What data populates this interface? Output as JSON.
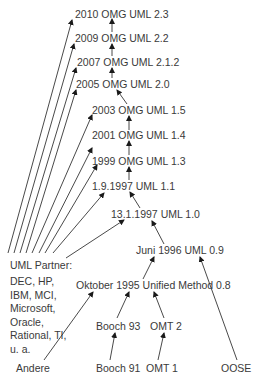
{
  "diagram": {
    "nodes": {
      "uml23": "2010 OMG UML 2.3",
      "uml22": "2009 OMG UML 2.2",
      "uml212": "2007 OMG UML 2.1.2",
      "uml20": "2005 OMG UML 2.0",
      "uml15": "2003 OMG UML 1.5",
      "uml14": "2001 OMG UML 1.4",
      "uml13": "1999 OMG UML 1.3",
      "uml11": "1.9.1997 UML 1.1",
      "uml10": "13.1.1997 UML 1.0",
      "uml09": "Juni 1996 UML 0.9",
      "um08": "Oktober 1995 Unified Method 0.8",
      "booch93": "Booch 93",
      "omt2": "OMT 2",
      "booch91": "Booch 91",
      "omt1": "OMT 1",
      "oose": "OOSE",
      "andere": "Andere",
      "partner": "UML Partner:",
      "partner_list": "DEC, HP,\nIBM, MCI,\nMicrosoft,\nOracle,\nRational, TI,\nu. a."
    },
    "edges": [
      [
        "uml22",
        "uml23"
      ],
      [
        "uml212",
        "uml22"
      ],
      [
        "uml20",
        "uml212"
      ],
      [
        "uml15",
        "uml20"
      ],
      [
        "uml14",
        "uml15"
      ],
      [
        "uml13",
        "uml14"
      ],
      [
        "uml11",
        "uml13"
      ],
      [
        "uml10",
        "uml11"
      ],
      [
        "uml09",
        "uml10"
      ],
      [
        "um08",
        "uml09"
      ],
      [
        "booch93",
        "um08"
      ],
      [
        "omt2",
        "um08"
      ],
      [
        "booch91",
        "booch93"
      ],
      [
        "omt1",
        "omt2"
      ],
      [
        "oose",
        "uml09"
      ],
      [
        "andere",
        "um08"
      ],
      [
        "partner",
        "uml23"
      ],
      [
        "partner",
        "uml22"
      ],
      [
        "partner",
        "uml212"
      ],
      [
        "partner",
        "uml20"
      ],
      [
        "partner",
        "uml15"
      ],
      [
        "partner",
        "uml14"
      ],
      [
        "partner",
        "uml13"
      ],
      [
        "partner",
        "uml11"
      ],
      [
        "partner",
        "uml10"
      ]
    ],
    "colors": {
      "line": "#1a1a1a",
      "text": "#3a3a3a",
      "background": "#ffffff"
    }
  }
}
